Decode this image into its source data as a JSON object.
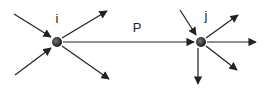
{
  "diagram": {
    "type": "network-flow",
    "colors": {
      "stroke": "#222222",
      "node_fill": "#2a2a2a",
      "node_highlight": "#777777",
      "background": "#ffffff"
    },
    "nodes": [
      {
        "id": "i",
        "label": "i",
        "x": 57,
        "y": 42,
        "label_x": 57,
        "label_y": 23
      },
      {
        "id": "j",
        "label": "j",
        "x": 201,
        "y": 42,
        "label_x": 206,
        "label_y": 20
      }
    ],
    "edges": [
      {
        "name": "in-i-upper",
        "x1": 14,
        "y1": 14,
        "x2": 51,
        "y2": 37
      },
      {
        "name": "in-i-lower",
        "x1": 15,
        "y1": 75,
        "x2": 51,
        "y2": 48
      },
      {
        "name": "out-i-upper",
        "x1": 62,
        "y1": 38,
        "x2": 107,
        "y2": 11
      },
      {
        "name": "out-i-lower",
        "x1": 62,
        "y1": 46,
        "x2": 109,
        "y2": 79
      },
      {
        "name": "path-i-j",
        "x1": 63,
        "y1": 42,
        "x2": 194,
        "y2": 42
      },
      {
        "name": "in-j-upper",
        "x1": 180,
        "y1": 10,
        "x2": 196,
        "y2": 35
      },
      {
        "name": "out-j-upper",
        "x1": 206,
        "y1": 38,
        "x2": 238,
        "y2": 15
      },
      {
        "name": "out-j-right",
        "x1": 207,
        "y1": 42,
        "x2": 256,
        "y2": 42
      },
      {
        "name": "out-j-lower",
        "x1": 206,
        "y1": 46,
        "x2": 237,
        "y2": 70
      },
      {
        "name": "out-j-down",
        "x1": 198,
        "y1": 48,
        "x2": 198,
        "y2": 84
      }
    ],
    "edge_label": {
      "text": "P",
      "x": 137,
      "y": 32
    }
  }
}
